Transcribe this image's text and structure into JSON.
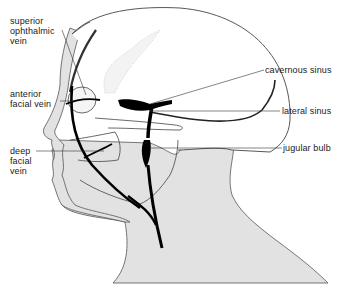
{
  "figure": {
    "colors": {
      "skin_fill": "#e2e2e2",
      "outline": "#444444",
      "vein": "#000000",
      "leader": "#333333",
      "background": "#ffffff"
    },
    "labels": {
      "superior_ophthalmic_vein": "superior\nophthalmic\nvein",
      "anterior_facial_vein": "anterior\nfacial vein",
      "deep_facial_vein": "deep\nfacial\nvein",
      "cavernous_sinus": "cavernous sinus",
      "lateral_sinus": "lateral sinus",
      "jugular_bulb": "jugular bulb"
    }
  }
}
